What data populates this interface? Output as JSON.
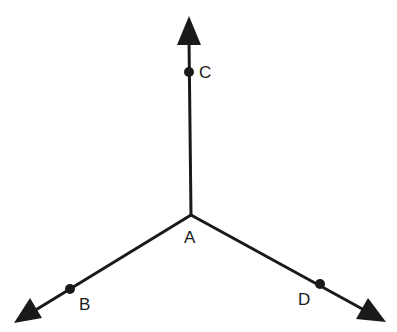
{
  "diagram": {
    "type": "rays-from-common-endpoint",
    "stroke_color": "#1a1a1a",
    "vertex": {
      "label": "A",
      "x": 191,
      "y": 215,
      "label_x": 191,
      "label_y": 243
    },
    "rays": [
      {
        "name": "ray-AC",
        "tip": [
          189,
          16
        ],
        "point": {
          "label": "C",
          "x": 189,
          "y": 72,
          "label_x": 206,
          "label_y": 78
        }
      },
      {
        "name": "ray-AB",
        "tip": [
          14,
          323
        ],
        "point": {
          "label": "B",
          "x": 70,
          "y": 289,
          "label_x": 86,
          "label_y": 310
        }
      },
      {
        "name": "ray-AD",
        "tip": [
          386,
          322
        ],
        "point": {
          "label": "D",
          "x": 320,
          "y": 284,
          "label_x": 304,
          "label_y": 305
        }
      }
    ]
  }
}
